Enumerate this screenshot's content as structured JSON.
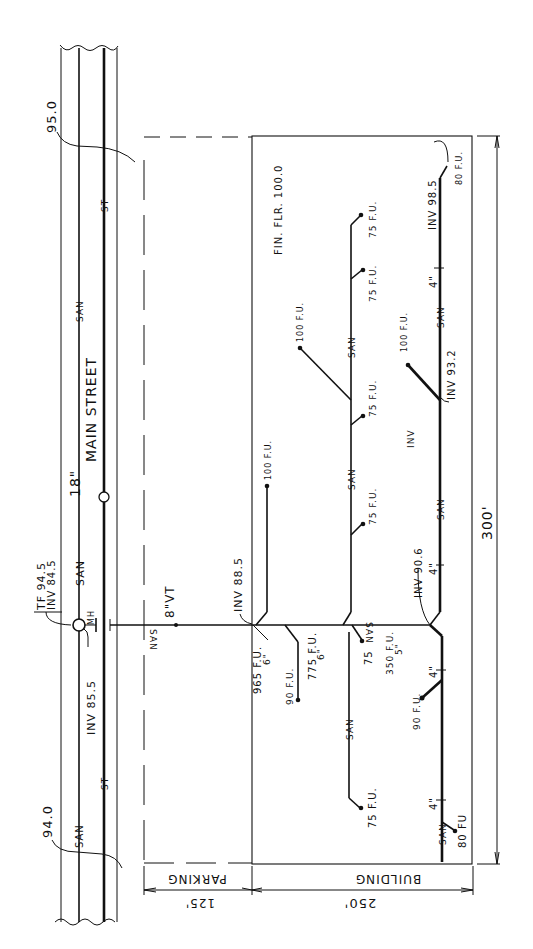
{
  "drawing": {
    "type": "site plan - building sanitary drainage",
    "ink_color": "#111111",
    "paper_color": "#ffffff"
  },
  "street": {
    "name": "MAIN STREET",
    "sewer_size": "18\"",
    "san_label": "SAN",
    "storm_label": "ST",
    "contour_top": "95.0",
    "contour_bottom": "94.0",
    "manhole": {
      "label": "MH",
      "tf": "TF 94.5",
      "inv_in": "INV 84.5",
      "inv_out": "INV 85.5"
    },
    "san_labels": [
      "SAN",
      "SAN",
      "SAN"
    ],
    "st_labels": [
      "ST",
      "ST"
    ]
  },
  "site": {
    "parking_label": "PARKING",
    "building_label": "BUILDING",
    "dim_parking": "125'",
    "dim_building": "250'",
    "dim_length": "300'",
    "fin_flr": "FIN. FLR. 100.0"
  },
  "building_sewer": {
    "size": "8\"VT",
    "san": "SAN",
    "inv_main": "INV 88.5",
    "main_fu": "965 F.U.",
    "main_size": "6\""
  },
  "branches": {
    "branch_a": {
      "label": "100 F.U."
    },
    "branch_b": {
      "fu": "775 F.U.",
      "size": "6\"",
      "fixture": "90 F.U."
    },
    "branch_c": {
      "san": "SAN",
      "fixtures": [
        "75 F.U.",
        "75 F.U.",
        "100 F.U.",
        "75 F.U.",
        "75 F.U.",
        "75 F.U.",
        "75 F.U."
      ],
      "near_junction": "75"
    },
    "branch_d": {
      "fu": "350 F.U.",
      "size": "5\"",
      "san": "SAN",
      "inv_junction": "INV 90.6",
      "size_4": "4\"",
      "inv_mid": "INV 93.2",
      "inv_end": "INV 98.5",
      "inv_short": "INV",
      "fixtures": [
        "80 F.U.",
        "100 F.U.",
        "90 F.U.",
        "80 FU"
      ]
    }
  }
}
